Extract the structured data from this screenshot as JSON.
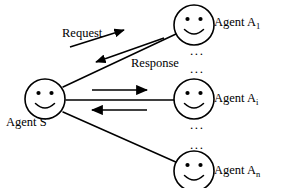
{
  "diagram": {
    "background_color": "#ffffff",
    "stroke_color": "#000000",
    "nodes": [
      {
        "id": "agent-s",
        "label_prefix": "Agent S",
        "label_subscript": "",
        "icon": "smiley-face-icon",
        "cx": 45,
        "cy": 99,
        "r": 20
      },
      {
        "id": "agent-a1",
        "label_prefix": "Agent A",
        "label_subscript": "1",
        "icon": "smiley-face-icon",
        "cx": 194,
        "cy": 25,
        "r": 20
      },
      {
        "id": "agent-ai",
        "label_prefix": "Agent A",
        "label_subscript": "i",
        "icon": "smiley-face-icon",
        "cx": 194,
        "cy": 99,
        "r": 20
      },
      {
        "id": "agent-an",
        "label_prefix": "Agent A",
        "label_subscript": "n",
        "icon": "smiley-face-icon",
        "cx": 194,
        "cy": 171,
        "r": 20
      }
    ],
    "edge_labels": {
      "request": "Request",
      "response": "Response"
    },
    "ellipsis": {
      "glyph": "...",
      "upper_count": 2,
      "lower_count": 2
    }
  }
}
